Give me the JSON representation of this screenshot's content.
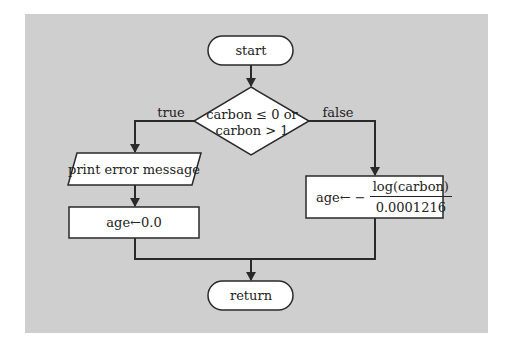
{
  "diagram": {
    "type": "flowchart",
    "background_color": "#cfcfcf",
    "nodes": {
      "start": {
        "shape": "terminal",
        "label": "start"
      },
      "decision": {
        "shape": "diamond",
        "line1": "carbon ≤ 0 or",
        "line2": "carbon > 1"
      },
      "print_error": {
        "shape": "parallelogram",
        "label": "print error message"
      },
      "age_zero": {
        "shape": "process",
        "label": "age←0.0"
      },
      "age_calc": {
        "shape": "process",
        "prefix": "age← −",
        "numerator": "log(carbon)",
        "denominator": "0.0001216"
      },
      "return": {
        "shape": "terminal",
        "label": "return"
      }
    },
    "edges": [
      {
        "from": "start",
        "to": "decision",
        "label": ""
      },
      {
        "from": "decision",
        "to": "print_error",
        "label": "true"
      },
      {
        "from": "decision",
        "to": "age_calc",
        "label": "false"
      },
      {
        "from": "print_error",
        "to": "age_zero",
        "label": ""
      },
      {
        "from": "age_zero",
        "to": "return",
        "label": ""
      },
      {
        "from": "age_calc",
        "to": "return",
        "label": ""
      }
    ],
    "edge_labels": {
      "true": "true",
      "false": "false"
    }
  }
}
